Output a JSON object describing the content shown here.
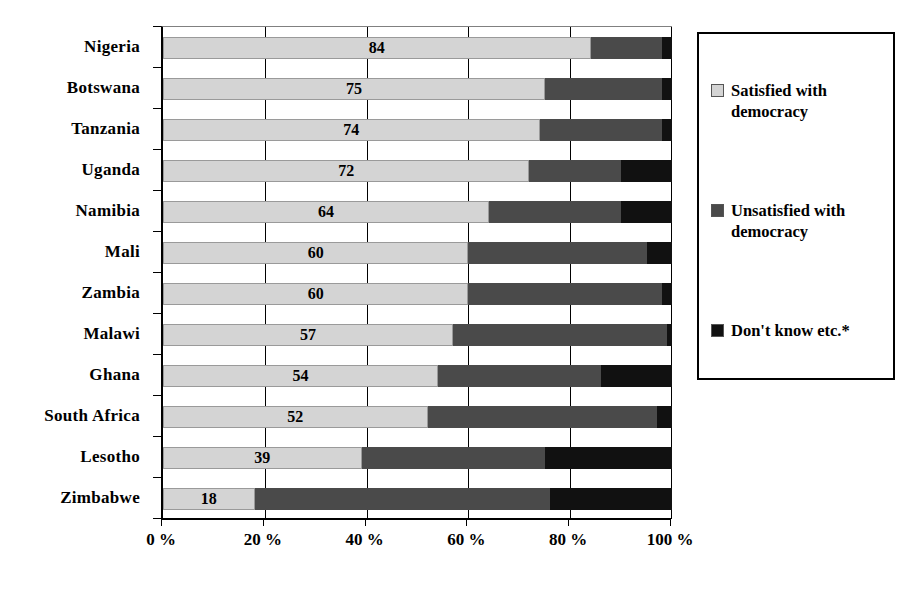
{
  "chart_data": {
    "type": "bar",
    "orientation": "horizontal",
    "stacked": true,
    "stack_total": 100,
    "title": "",
    "subtitle": "",
    "xlabel": "",
    "ylabel": "",
    "xlim": [
      0,
      100
    ],
    "grid": true,
    "legend_position": "right",
    "categories": [
      "Nigeria",
      "Botswana",
      "Tanzania",
      "Uganda",
      "Namibia",
      "Mali",
      "Zambia",
      "Malawi",
      "Ghana",
      "South Africa",
      "Lesotho",
      "Zimbabwe"
    ],
    "series": [
      {
        "name": "Satisfied with democracy",
        "color": "#d4d4d4",
        "values": [
          84,
          75,
          74,
          72,
          64,
          60,
          60,
          57,
          54,
          52,
          39,
          18
        ]
      },
      {
        "name": "Unsatisfied with democracy",
        "color": "#4a4a4a",
        "values": [
          14,
          23,
          24,
          18,
          26,
          35,
          38,
          42,
          32,
          45,
          36,
          58
        ]
      },
      {
        "name": "Don't know etc.*",
        "color": "#111111",
        "values": [
          2,
          2,
          2,
          10,
          10,
          5,
          2,
          1,
          14,
          3,
          25,
          24
        ]
      }
    ],
    "data_labels": [
      "84",
      "75",
      "74",
      "72",
      "64",
      "60",
      "60",
      "57",
      "54",
      "52",
      "39",
      "18"
    ],
    "xticks": [
      0,
      20,
      40,
      60,
      80,
      100
    ],
    "xtick_labels": [
      "0 %",
      "20 %",
      "40 %",
      "60 %",
      "80 %",
      "100 %"
    ]
  },
  "legend": {
    "items": [
      {
        "label": "Satisfied with\ndemocracy",
        "color": "#d4d4d4"
      },
      {
        "label": "Unsatisfied with\ndemocracy",
        "color": "#4a4a4a"
      },
      {
        "label": "Don't know etc.*",
        "color": "#111111"
      }
    ]
  }
}
